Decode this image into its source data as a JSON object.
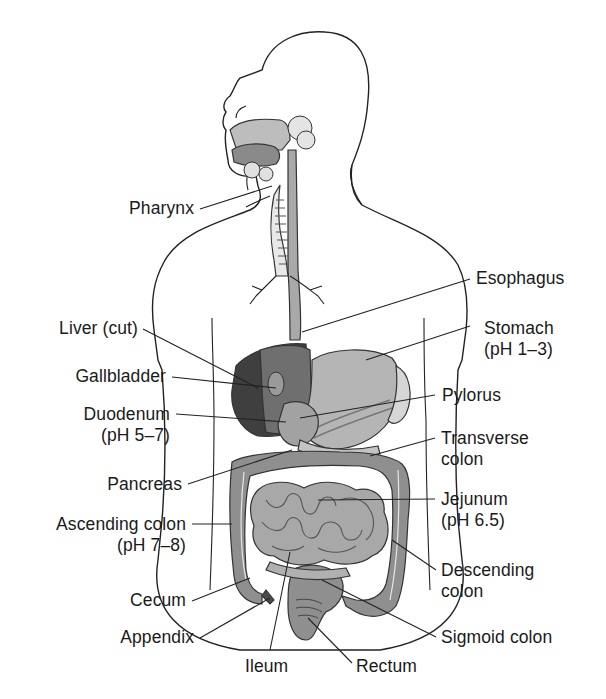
{
  "figure": {
    "colors": {
      "outline": "#222222",
      "light_gray": "#c9c9c9",
      "mid_gray": "#9a9a9a",
      "dark_gray": "#555555",
      "liver_dark": "#3a3a3a",
      "background": "#ffffff"
    }
  },
  "labels": {
    "pharynx": {
      "text": "Pharynx"
    },
    "esophagus": {
      "text": "Esophagus"
    },
    "liver": {
      "text": "Liver (cut)"
    },
    "stomach": {
      "text": "Stomach",
      "sub": "(pH 1–3)"
    },
    "gallbladder": {
      "text": "Gallbladder"
    },
    "pylorus": {
      "text": "Pylorus"
    },
    "duodenum": {
      "text": "Duodenum",
      "sub": "(pH 5–7)"
    },
    "transverse_colon": {
      "text": "Transverse",
      "sub": "colon"
    },
    "pancreas": {
      "text": "Pancreas"
    },
    "jejunum": {
      "text": "Jejunum",
      "sub": "(pH 6.5)"
    },
    "ascending_colon": {
      "text": "Ascending colon",
      "sub": "(pH 7–8)"
    },
    "descending_colon": {
      "text": "Descending",
      "sub": "colon"
    },
    "cecum": {
      "text": "Cecum"
    },
    "appendix": {
      "text": "Appendix"
    },
    "sigmoid_colon": {
      "text": "Sigmoid colon"
    },
    "ileum": {
      "text": "Ileum"
    },
    "rectum": {
      "text": "Rectum"
    }
  }
}
